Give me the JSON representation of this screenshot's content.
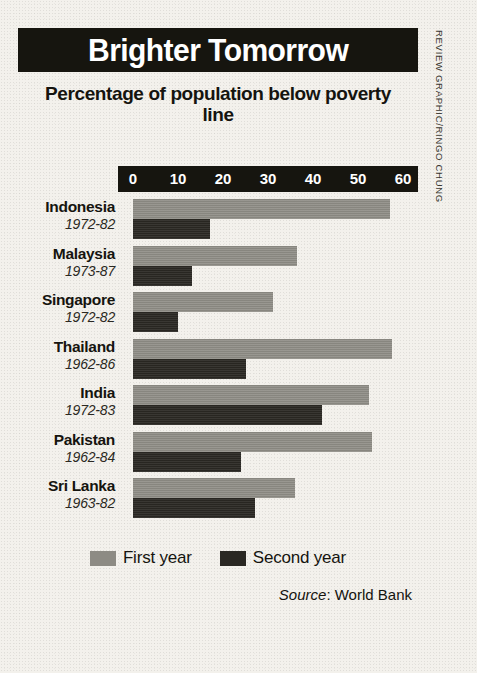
{
  "title": "Brighter Tomorrow",
  "subtitle": "Percentage of population below poverty line",
  "credit": "REVIEW GRAPHIC/RINGO CHUNG",
  "source": {
    "word": "Source",
    "separator": ": ",
    "value": "World Bank"
  },
  "legend": {
    "first": "First year",
    "second": "Second year"
  },
  "colors": {
    "banner": "#16150f",
    "banner_text": "#ffffff",
    "paper": "#f3f1ec",
    "first_year_bar": "#8d8b84",
    "second_year_bar": "#2a2823",
    "text": "#15140f"
  },
  "chart_data": {
    "type": "bar",
    "orientation": "horizontal",
    "title": "Brighter Tomorrow",
    "subtitle": "Percentage of population below poverty line",
    "xlabel": "Percentage of population below poverty line",
    "ylabel": "",
    "xlim": [
      0,
      60
    ],
    "xticks": [
      0,
      10,
      20,
      30,
      40,
      50,
      60
    ],
    "tick_labels": [
      "0",
      "10",
      "20",
      "30",
      "40",
      "50",
      "60"
    ],
    "grid": false,
    "legend_position": "bottom-center",
    "source": "World Bank",
    "categories": [
      "Indonesia",
      "Malaysia",
      "Singapore",
      "Thailand",
      "India",
      "Pakistan",
      "Sri Lanka"
    ],
    "category_years": [
      "1972-82",
      "1973-87",
      "1972-82",
      "1962-86",
      "1972-83",
      "1962-84",
      "1963-82"
    ],
    "series": [
      {
        "name": "First year",
        "color": "#8d8b84",
        "values": [
          57,
          36.5,
          31,
          57.5,
          52.5,
          53,
          36
        ]
      },
      {
        "name": "Second year",
        "color": "#2a2823",
        "values": [
          17,
          13,
          10,
          25,
          42,
          24,
          27
        ]
      }
    ],
    "rows": [
      {
        "country": "Indonesia",
        "years": "1972-82",
        "first": 57,
        "second": 17
      },
      {
        "country": "Malaysia",
        "years": "1973-87",
        "first": 36.5,
        "second": 13
      },
      {
        "country": "Singapore",
        "years": "1972-82",
        "first": 31,
        "second": 10
      },
      {
        "country": "Thailand",
        "years": "1962-86",
        "first": 57.5,
        "second": 25
      },
      {
        "country": "India",
        "years": "1972-83",
        "first": 52.5,
        "second": 42
      },
      {
        "country": "Pakistan",
        "years": "1962-84",
        "first": 53,
        "second": 24
      },
      {
        "country": "Sri Lanka",
        "years": "1963-82",
        "first": 36,
        "second": 27
      }
    ]
  }
}
